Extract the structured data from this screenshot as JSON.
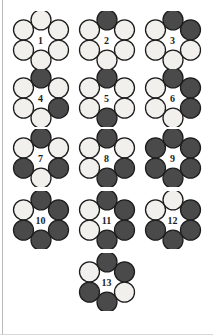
{
  "figure": {
    "top_caption": "",
    "colors": {
      "light_fill": "#f2f0ec",
      "dark_fill": "#4a4a4a",
      "stroke": "#1d1d1d",
      "background": "#ffffff",
      "rule": "#b9b9b9",
      "label": "#1d1d1d"
    },
    "vertex_order": [
      "top",
      "upper-right",
      "lower-right",
      "bottom",
      "lower-left",
      "upper-left"
    ],
    "rows": [
      {
        "row_label": "row-1",
        "ring_ids": [
          1,
          2,
          3
        ]
      },
      {
        "row_label": "row-2",
        "ring_ids": [
          4,
          5,
          6
        ]
      },
      {
        "row_label": "row-3",
        "ring_ids": [
          7,
          8,
          9
        ]
      },
      {
        "row_label": "row-4",
        "ring_ids": [
          10,
          11,
          12
        ]
      },
      {
        "row_label": "row-5",
        "ring_ids": [
          13
        ]
      }
    ],
    "rings": [
      {
        "id": 1,
        "label": "1",
        "dark_count": 0,
        "light_count": 6,
        "vertices": [
          "light",
          "light",
          "light",
          "light",
          "light",
          "light"
        ]
      },
      {
        "id": 2,
        "label": "2",
        "dark_count": 1,
        "light_count": 5,
        "vertices": [
          "dark",
          "light",
          "light",
          "light",
          "light",
          "light"
        ]
      },
      {
        "id": 3,
        "label": "3",
        "dark_count": 2,
        "light_count": 4,
        "vertices": [
          "dark",
          "dark",
          "light",
          "light",
          "light",
          "light"
        ]
      },
      {
        "id": 4,
        "label": "4",
        "dark_count": 2,
        "light_count": 4,
        "vertices": [
          "dark",
          "light",
          "dark",
          "light",
          "light",
          "light"
        ]
      },
      {
        "id": 5,
        "label": "5",
        "dark_count": 2,
        "light_count": 4,
        "vertices": [
          "dark",
          "light",
          "light",
          "dark",
          "light",
          "light"
        ]
      },
      {
        "id": 6,
        "label": "6",
        "dark_count": 3,
        "light_count": 3,
        "vertices": [
          "dark",
          "dark",
          "dark",
          "light",
          "light",
          "light"
        ]
      },
      {
        "id": 7,
        "label": "7",
        "dark_count": 3,
        "light_count": 3,
        "vertices": [
          "dark",
          "light",
          "dark",
          "light",
          "dark",
          "light"
        ]
      },
      {
        "id": 8,
        "label": "8",
        "dark_count": 3,
        "light_count": 3,
        "vertices": [
          "dark",
          "light",
          "dark",
          "dark",
          "light",
          "light"
        ]
      },
      {
        "id": 9,
        "label": "9",
        "dark_count": 6,
        "light_count": 0,
        "vertices": [
          "dark",
          "dark",
          "dark",
          "dark",
          "dark",
          "dark"
        ]
      },
      {
        "id": 10,
        "label": "10",
        "dark_count": 5,
        "light_count": 1,
        "vertices": [
          "dark",
          "dark",
          "dark",
          "dark",
          "dark",
          "light"
        ]
      },
      {
        "id": 11,
        "label": "11",
        "dark_count": 4,
        "light_count": 2,
        "vertices": [
          "dark",
          "dark",
          "dark",
          "dark",
          "light",
          "light"
        ]
      },
      {
        "id": 12,
        "label": "12",
        "dark_count": 4,
        "light_count": 2,
        "vertices": [
          "light",
          "dark",
          "dark",
          "dark",
          "dark",
          "light"
        ]
      },
      {
        "id": 13,
        "label": "13",
        "dark_count": 4,
        "light_count": 2,
        "vertices": [
          "dark",
          "dark",
          "light",
          "dark",
          "dark",
          "light"
        ]
      }
    ]
  }
}
